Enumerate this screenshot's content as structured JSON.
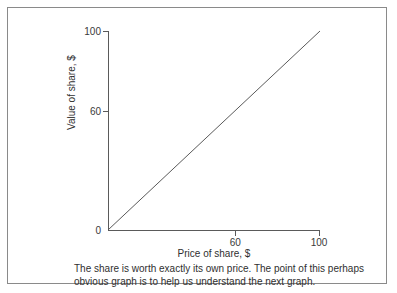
{
  "figure": {
    "frame_color": "#8a8a8a",
    "background": "#ffffff"
  },
  "caption": {
    "line1": "The share is worth exactly its own price. The point of this perhaps",
    "line2": "obvious graph is to help us understand the next graph."
  },
  "chart_data": {
    "type": "line",
    "title": "",
    "xlabel": "Price of share, $",
    "ylabel": "Value of share, $",
    "xlim": [
      0,
      100
    ],
    "ylim": [
      0,
      100
    ],
    "xticks": [
      0,
      60,
      100
    ],
    "xticklabels": [
      "0",
      "60",
      "100"
    ],
    "yticks": [
      0,
      60,
      100
    ],
    "yticklabels": [
      "0",
      "60",
      "100"
    ],
    "grid": false,
    "legend": "none",
    "line_color": "#5a5a5a",
    "series": [
      {
        "name": "value equals price",
        "x": [
          0,
          100
        ],
        "y": [
          0,
          100
        ]
      }
    ]
  }
}
